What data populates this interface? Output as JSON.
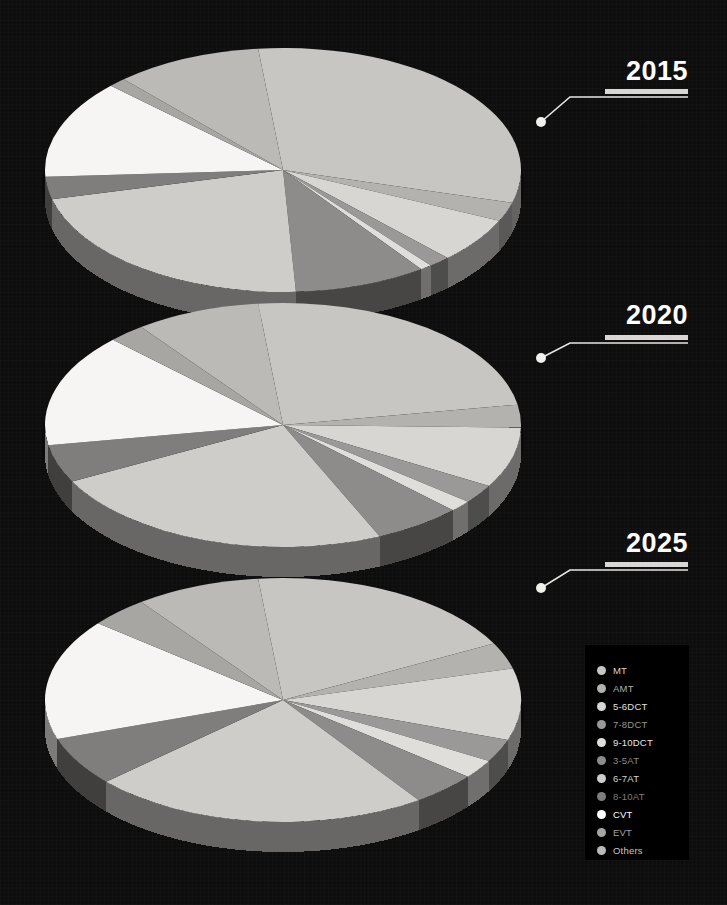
{
  "background": {
    "color": "#0d0d0d",
    "panel_color": "#000000"
  },
  "chart_data": {
    "type": "pie",
    "note": "Three stacked 3-D pie charts comparing transmission mix across three years",
    "categories": [
      "MT",
      "AMT",
      "5-6DCT",
      "7-8DCT",
      "9-10DCT",
      "3-5AT",
      "6-7AT",
      "8-10AT",
      "CVT",
      "EVT",
      "Others"
    ],
    "colors": [
      "#c8c6c3",
      "#b4b2af",
      "#d8d6d3",
      "#9a9997",
      "#e0dedb",
      "#8d8c8a",
      "#cfcdca",
      "#7f7e7c",
      "#f6f5f3",
      "#a8a6a3",
      "#bcbab7"
    ],
    "legend_position": "bottom-right",
    "series": [
      {
        "name": "2015",
        "values": [
          31.0,
          2.5,
          6.0,
          1.5,
          0.8,
          9.0,
          22.0,
          3.0,
          13.0,
          1.2,
          10.0
        ]
      },
      {
        "name": "2020",
        "values": [
          24.0,
          3.0,
          8.0,
          2.5,
          1.5,
          6.0,
          24.0,
          5.0,
          15.0,
          2.5,
          8.5
        ]
      },
      {
        "name": "2025",
        "values": [
          19.0,
          3.5,
          9.5,
          3.0,
          2.5,
          4.5,
          23.0,
          6.5,
          16.0,
          4.0,
          8.5
        ]
      }
    ]
  },
  "callouts": [
    {
      "year": "2015"
    },
    {
      "year": "2020"
    },
    {
      "year": "2025"
    }
  ],
  "legend": {
    "items": [
      {
        "label": "MT",
        "color": "#c8c6c3",
        "text_color": "#d8d6d3"
      },
      {
        "label": "AMT",
        "color": "#b4b2af",
        "text_color": "#b0aeab"
      },
      {
        "label": "5-6DCT",
        "color": "#d8d6d3",
        "text_color": "#e2e0dd"
      },
      {
        "label": "7-8DCT",
        "color": "#9a9997",
        "text_color": "#979593"
      },
      {
        "label": "9-10DCT",
        "color": "#e0dedb",
        "text_color": "#e6e4e1"
      },
      {
        "label": "3-5AT",
        "color": "#8d8c8a",
        "text_color": "#8b8a88"
      },
      {
        "label": "6-7AT",
        "color": "#cfcdca",
        "text_color": "#d6d4d1"
      },
      {
        "label": "8-10AT",
        "color": "#7f7e7c",
        "text_color": "#7d7c7a"
      },
      {
        "label": "CVT",
        "color": "#ffffff",
        "text_color": "#ffffff"
      },
      {
        "label": "EVT",
        "color": "#a8a6a3",
        "text_color": "#a5a3a0"
      },
      {
        "label": "Others",
        "color": "#bcbab7",
        "text_color": "#c6c4c1"
      }
    ]
  }
}
